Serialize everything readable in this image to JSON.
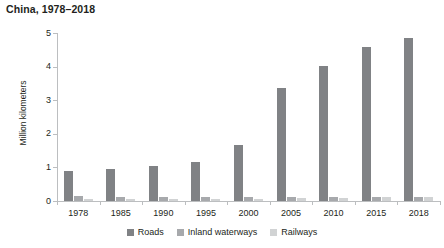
{
  "chart_data": {
    "type": "bar",
    "title": "China, 1978–2018",
    "xlabel": "",
    "ylabel": "Million kilometers",
    "categories": [
      "1978",
      "1985",
      "1990",
      "1995",
      "2000",
      "2005",
      "2010",
      "2015",
      "2018"
    ],
    "series": [
      {
        "name": "Roads",
        "color": "#808285",
        "values": [
          0.89,
          0.94,
          1.04,
          1.16,
          1.68,
          3.35,
          4.01,
          4.58,
          4.85
        ]
      },
      {
        "name": "Inland waterways",
        "color": "#a7a9ac",
        "values": [
          0.14,
          0.11,
          0.11,
          0.11,
          0.12,
          0.12,
          0.12,
          0.13,
          0.13
        ]
      },
      {
        "name": "Railways",
        "color": "#d1d3d4",
        "values": [
          0.05,
          0.05,
          0.06,
          0.06,
          0.07,
          0.08,
          0.09,
          0.12,
          0.13
        ]
      }
    ],
    "yticks": [
      0,
      1,
      2,
      3,
      4,
      5
    ],
    "ytick_labels": [
      "0",
      "1",
      "2",
      "3",
      "4",
      "5"
    ],
    "ylim": [
      0,
      5
    ],
    "grid": false,
    "legend_position": "bottom"
  },
  "legend": {
    "items": [
      {
        "label": "Roads"
      },
      {
        "label": "Inland waterways"
      },
      {
        "label": "Railways"
      }
    ]
  }
}
